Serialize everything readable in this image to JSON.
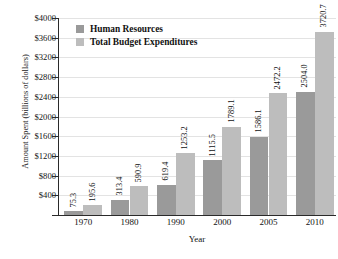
{
  "chart_data": {
    "type": "bar",
    "title": "Federal Budget Expenditures",
    "xlabel": "Year",
    "ylabel": "Amount Spent (billions of dollars)",
    "categories": [
      "1970",
      "1980",
      "1990",
      "2000",
      "2005",
      "2010"
    ],
    "series": [
      {
        "name": "Human Resources",
        "color": "#9a9a9a",
        "values": [
          75.3,
          313.4,
          619.4,
          1115.5,
          1586.1,
          2504.0
        ],
        "labels": [
          "75.3",
          "313.4",
          "619.4",
          "1115.5",
          "1586.1",
          "2504.0"
        ]
      },
      {
        "name": "Total Budget Expenditures",
        "color": "#bdbdbd",
        "values": [
          195.6,
          590.9,
          1253.2,
          1789.1,
          2472.2,
          3720.7
        ],
        "labels": [
          "195.6",
          "590.9",
          "1253.2",
          "1789.1",
          "2472.2",
          "3720.7"
        ]
      }
    ],
    "ylim": [
      0,
      4000
    ],
    "ytick_step": 400,
    "ytick_labels": [
      "$400",
      "$800",
      "$1200",
      "$1600",
      "$2000",
      "$2400",
      "$2800",
      "$3200",
      "$3600",
      "$4000"
    ],
    "ytick_values": [
      400,
      800,
      1200,
      1600,
      2000,
      2400,
      2800,
      3200,
      3600,
      4000
    ],
    "grid": true,
    "legend_position": "top-left"
  }
}
